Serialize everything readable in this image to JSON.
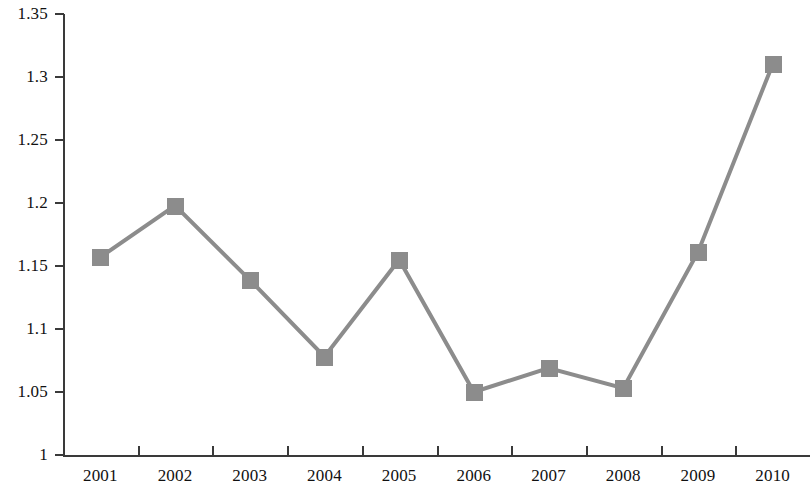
{
  "chart_data": {
    "type": "line",
    "title": "",
    "subtitle": "",
    "xlabel": "",
    "ylabel": "",
    "categories": [
      "2001",
      "2002",
      "2003",
      "2004",
      "2005",
      "2006",
      "2007",
      "2008",
      "2009",
      "2010"
    ],
    "values": [
      1.157,
      1.198,
      1.139,
      1.078,
      1.155,
      1.05,
      1.069,
      1.053,
      1.161,
      1.31
    ],
    "series": [
      {
        "name": "",
        "values": [
          1.157,
          1.198,
          1.139,
          1.078,
          1.155,
          1.05,
          1.069,
          1.053,
          1.161,
          1.31
        ]
      }
    ],
    "ylim": [
      1,
      1.35
    ],
    "y_ticks": [
      1,
      1.05,
      1.1,
      1.15,
      1.2,
      1.25,
      1.3,
      1.35
    ],
    "y_tick_labels": [
      "1",
      "1.05",
      "1.1",
      "1.15",
      "1.2",
      "1.25",
      "1.3",
      "1.35"
    ],
    "x_tick_labels": [
      "2001",
      "2002",
      "2003",
      "2004",
      "2005",
      "2006",
      "2007",
      "2008",
      "2009",
      "2010"
    ],
    "grid": false,
    "legend": false,
    "legend_position": "none",
    "marker": "square",
    "line_color": "#8c8c8c",
    "marker_color": "#8c8c8c",
    "axis_color": "#3a3a3a",
    "background_color": "#ffffff",
    "annotations": []
  }
}
